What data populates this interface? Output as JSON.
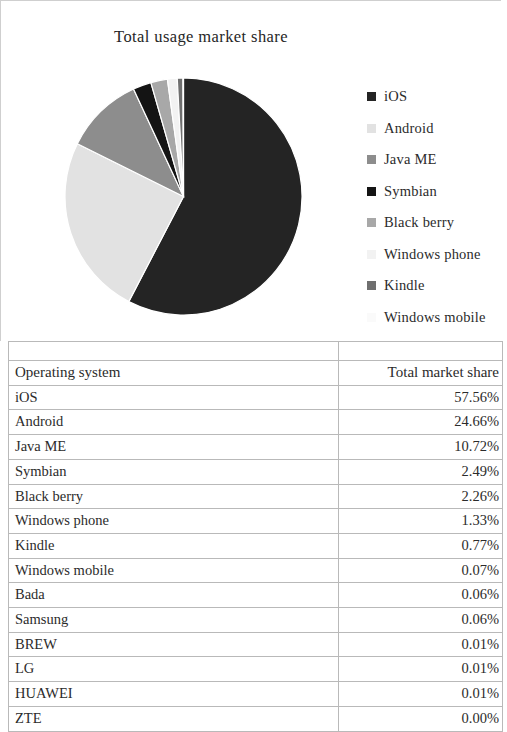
{
  "chart": {
    "title": "Total usage market share"
  },
  "legend": {
    "items": [
      {
        "label": "iOS",
        "color": "#242424",
        "swatch": "legend-swatch-ios"
      },
      {
        "label": "Android",
        "color": "#e2e2e2",
        "swatch": "legend-swatch-android"
      },
      {
        "label": "Java ME",
        "color": "#8d8d8d",
        "swatch": "legend-swatch-java-me"
      },
      {
        "label": "Symbian",
        "color": "#141414",
        "swatch": "legend-swatch-symbian"
      },
      {
        "label": "Black berry",
        "color": "#a8a8a8",
        "swatch": "legend-swatch-black-berry"
      },
      {
        "label": "Windows phone",
        "color": "#f2f2f2",
        "swatch": "legend-swatch-windows-phone"
      },
      {
        "label": "Kindle",
        "color": "#6f6f6f",
        "swatch": "legend-swatch-kindle"
      },
      {
        "label": "Windows mobile",
        "color": "#fafafa",
        "swatch": "legend-swatch-windows-mobile"
      }
    ]
  },
  "table": {
    "headers": [
      "Operating system",
      "Total market share"
    ],
    "rows": [
      {
        "os": "iOS",
        "share": "57.56%"
      },
      {
        "os": "Android",
        "share": "24.66%"
      },
      {
        "os": "Java ME",
        "share": "10.72%"
      },
      {
        "os": "Symbian",
        "share": "2.49%"
      },
      {
        "os": "Black berry",
        "share": "2.26%"
      },
      {
        "os": "Windows phone",
        "share": "1.33%"
      },
      {
        "os": "Kindle",
        "share": "0.77%"
      },
      {
        "os": "Windows mobile",
        "share": "0.07%"
      },
      {
        "os": "Bada",
        "share": "0.06%"
      },
      {
        "os": "Samsung",
        "share": "0.06%"
      },
      {
        "os": "BREW",
        "share": "0.01%"
      },
      {
        "os": "LG",
        "share": "0.01%"
      },
      {
        "os": "HUAWEI",
        "share": "0.01%"
      },
      {
        "os": "ZTE",
        "share": "0.00%"
      }
    ]
  },
  "chart_data": {
    "type": "pie",
    "title": "Total usage market share",
    "xlabel": "",
    "ylabel": "",
    "legend_position": "right",
    "unit": "percent",
    "categories": [
      "iOS",
      "Android",
      "Java ME",
      "Symbian",
      "Black berry",
      "Windows phone",
      "Kindle",
      "Windows mobile"
    ],
    "values": [
      57.56,
      24.66,
      10.72,
      2.49,
      2.26,
      1.33,
      0.77,
      0.07
    ],
    "colors": [
      "#242424",
      "#e2e2e2",
      "#8d8d8d",
      "#141414",
      "#a8a8a8",
      "#f2f2f2",
      "#6f6f6f",
      "#fafafa"
    ],
    "start_angle_deg": 0,
    "direction": "clockwise",
    "table_categories": [
      "iOS",
      "Android",
      "Java ME",
      "Symbian",
      "Black berry",
      "Windows phone",
      "Kindle",
      "Windows mobile",
      "Bada",
      "Samsung",
      "BREW",
      "LG",
      "HUAWEI",
      "ZTE"
    ],
    "table_values": [
      57.56,
      24.66,
      10.72,
      2.49,
      2.26,
      1.33,
      0.77,
      0.07,
      0.06,
      0.06,
      0.01,
      0.01,
      0.01,
      0.0
    ]
  }
}
